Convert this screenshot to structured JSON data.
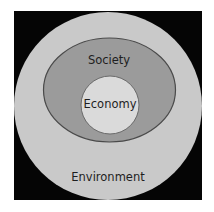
{
  "diagram": {
    "type": "nested-circles",
    "layers": [
      {
        "name": "outer",
        "label": "Environment",
        "fill": "#c9c9c9"
      },
      {
        "name": "middle",
        "label": "Society",
        "fill": "#9b9b9b",
        "stroke": "#4a4a4a"
      },
      {
        "name": "inner",
        "label": "Economy",
        "fill": "#dadada",
        "stroke": "#6a6a6a"
      }
    ],
    "background": "#050505"
  }
}
